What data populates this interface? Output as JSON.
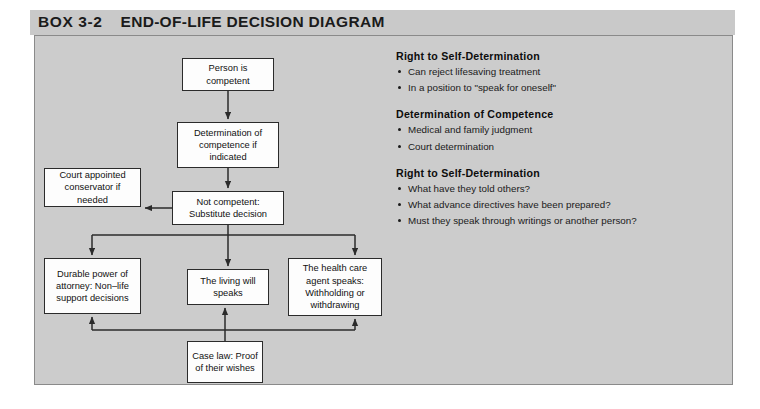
{
  "box": {
    "label": "BOX 3-2",
    "title": "END-OF-LIFE DECISION DIAGRAM"
  },
  "diagram": {
    "nodes": {
      "person_competent": "Person is competent",
      "determination": "Determination of competence if indicated",
      "not_competent": "Not competent: Substitute decision",
      "conservator": "Court appointed conservator if needed",
      "durable_power": "Durable power of attorney: Non–life support decisions",
      "living_will": "The living will speaks",
      "health_care_agent": "The health care agent speaks: Withholding or withdrawing",
      "case_law": "Case law: Proof of their wishes"
    }
  },
  "text_panel": {
    "sections": [
      {
        "title": "Right to Self-Determination",
        "bullets": [
          "Can reject lifesaving treatment",
          "In a position to \"speak for oneself\""
        ]
      },
      {
        "title": "Determination of Competence",
        "bullets": [
          "Medical and family judgment",
          "Court determination"
        ]
      },
      {
        "title": "Right to Self-Determination",
        "bullets": [
          "What have they told others?",
          "What advance directives have been prepared?",
          "Must they speak through writings or another person?"
        ]
      }
    ]
  },
  "colors": {
    "header_band": "#c9c9c9",
    "panel_fill": "#cccccc",
    "panel_border": "#8a8a8a",
    "node_fill": "#fdfdfd",
    "node_border": "#2b2b2b",
    "connector": "#2b2b2b",
    "page_background": "#ffffff"
  }
}
